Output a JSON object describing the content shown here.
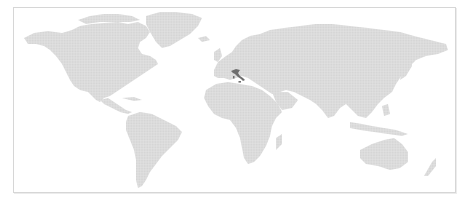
{
  "map": {
    "type": "world-choropleth",
    "projection": "equirectangular-like",
    "highlighted_regions": [
      {
        "name": "Italy",
        "color": "#6e6e6e"
      }
    ],
    "land_color": "#d9d9d9",
    "background_color": "#ffffff",
    "frame_border_color": "#d6d6d6"
  }
}
